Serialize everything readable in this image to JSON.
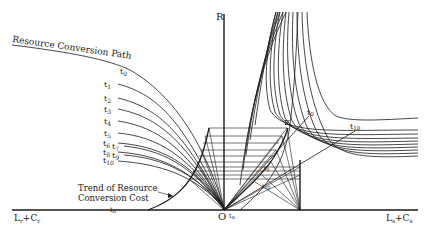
{
  "figure": {
    "axes": {
      "vertical_label": "R",
      "origin_label": "O",
      "left_axis_label": "L_r + C_r",
      "left_axis_label_base": "L",
      "left_axis_label_sub1": "r",
      "left_axis_label_plus": "+C",
      "left_axis_label_sub2": "r",
      "right_axis_label_base": "L",
      "right_axis_label_sub1": "s",
      "right_axis_label_plus": "+C",
      "right_axis_label_sub2": "s",
      "right_axis_label": "L_s + C_s"
    },
    "annotations": {
      "resource_conversion_path": "Resource Conversion Path",
      "trend_line1": "Trend of Resource",
      "trend_line2": "Conversion Cost",
      "point_e": "E"
    },
    "time_labels": {
      "t": "t",
      "left_curves": [
        "0",
        "1",
        "2",
        "3",
        "4",
        "5",
        "6",
        "7",
        "8",
        "9",
        "10"
      ],
      "t_n_base": "n",
      "right_t0": "0",
      "right_t10": "10",
      "inner_t0": "0",
      "inner_t10": "10",
      "origin_tn": "n"
    }
  }
}
